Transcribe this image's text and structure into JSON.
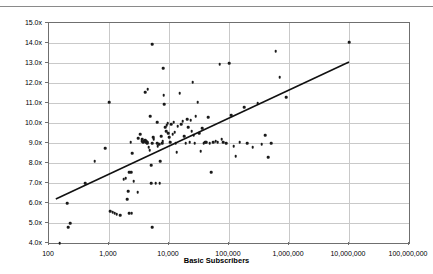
{
  "chart_data": {
    "type": "scatter",
    "title": "",
    "xlabel": "Basic Subscribers",
    "ylabel": "Multiple of Operating Cash Flow",
    "x_scale": "log",
    "y_scale": "linear",
    "xlim": [
      100,
      100000000
    ],
    "ylim": [
      4.0,
      15.0
    ],
    "grid": true,
    "legend": null,
    "x_ticks": [
      100,
      1000,
      10000,
      100000,
      1000000,
      10000000,
      100000000
    ],
    "x_tick_labels": [
      "100",
      "1,000",
      "10,000",
      "100,000",
      "1,000,000",
      "10,000,000",
      "100,000,000"
    ],
    "y_ticks": [
      4.0,
      5.0,
      6.0,
      7.0,
      8.0,
      9.0,
      10.0,
      11.0,
      12.0,
      13.0,
      14.0,
      15.0
    ],
    "y_tick_labels": [
      "4.0x",
      "5.0x",
      "6.0x",
      "7.0x",
      "8.0x",
      "9.0x",
      "10.0x",
      "11.0x",
      "12.0x",
      "13.0x",
      "14.0x",
      "15.0x"
    ],
    "series": [
      {
        "name": "Transactions",
        "marker": "diamond",
        "color": "#1a1a1a",
        "points": [
          [
            150,
            4.0
          ],
          [
            210,
            4.8
          ],
          [
            225,
            5.0
          ],
          [
            200,
            6.0
          ],
          [
            580,
            8.1
          ],
          [
            400,
            7.0
          ],
          [
            860,
            8.75
          ],
          [
            1000,
            11.05
          ],
          [
            1050,
            5.6
          ],
          [
            1150,
            5.55
          ],
          [
            1250,
            5.5
          ],
          [
            1350,
            5.45
          ],
          [
            1550,
            5.4
          ],
          [
            1750,
            7.2
          ],
          [
            1900,
            7.25
          ],
          [
            2000,
            6.2
          ],
          [
            2100,
            6.6
          ],
          [
            2150,
            5.5
          ],
          [
            2400,
            5.5
          ],
          [
            2150,
            7.55
          ],
          [
            2350,
            7.55
          ],
          [
            2300,
            9.05
          ],
          [
            2450,
            8.5
          ],
          [
            2600,
            7.1
          ],
          [
            3000,
            6.55
          ],
          [
            3100,
            9.25
          ],
          [
            3300,
            9.45
          ],
          [
            3500,
            9.1
          ],
          [
            3600,
            9.2
          ],
          [
            3700,
            9.05
          ],
          [
            3900,
            9.1
          ],
          [
            4000,
            9.15
          ],
          [
            4100,
            9.05
          ],
          [
            4200,
            9.1
          ],
          [
            4300,
            9.0
          ],
          [
            4400,
            9.05
          ],
          [
            4000,
            11.55
          ],
          [
            4400,
            11.7
          ],
          [
            4600,
            8.8
          ],
          [
            4800,
            8.65
          ],
          [
            4900,
            10.35
          ],
          [
            5000,
            7.0
          ],
          [
            5100,
            7.9
          ],
          [
            5200,
            4.8
          ],
          [
            5300,
            9.0
          ],
          [
            5400,
            9.3
          ],
          [
            5600,
            9.2
          ],
          [
            5300,
            13.95
          ],
          [
            6000,
            7.0
          ],
          [
            6300,
            9.0
          ],
          [
            6400,
            10.05
          ],
          [
            6500,
            8.85
          ],
          [
            6800,
            8.95
          ],
          [
            7000,
            7.0
          ],
          [
            7100,
            8.1
          ],
          [
            7400,
            9.35
          ],
          [
            7700,
            9.0
          ],
          [
            7900,
            9.1
          ],
          [
            8000,
            12.75
          ],
          [
            8200,
            11.4
          ],
          [
            8400,
            10.95
          ],
          [
            8700,
            9.8
          ],
          [
            9000,
            9.6
          ],
          [
            9200,
            9.9
          ],
          [
            9500,
            10.0
          ],
          [
            9800,
            9.5
          ],
          [
            10000,
            9.3
          ],
          [
            10500,
            9.05
          ],
          [
            11000,
            9.95
          ],
          [
            11500,
            9.45
          ],
          [
            12000,
            10.05
          ],
          [
            12500,
            9.55
          ],
          [
            13000,
            9.0
          ],
          [
            13500,
            8.55
          ],
          [
            14000,
            9.85
          ],
          [
            15000,
            11.5
          ],
          [
            16000,
            9.95
          ],
          [
            17000,
            10.1
          ],
          [
            18000,
            9.35
          ],
          [
            19000,
            9.0
          ],
          [
            20000,
            10.2
          ],
          [
            21000,
            9.8
          ],
          [
            22000,
            9.05
          ],
          [
            23000,
            10.15
          ],
          [
            24000,
            9.6
          ],
          [
            25000,
            12.05
          ],
          [
            26000,
            9.4
          ],
          [
            27000,
            9.0
          ],
          [
            28000,
            10.35
          ],
          [
            30000,
            11.05
          ],
          [
            32000,
            9.5
          ],
          [
            34000,
            8.6
          ],
          [
            36000,
            9.75
          ],
          [
            38000,
            9.0
          ],
          [
            40000,
            9.05
          ],
          [
            42000,
            9.05
          ],
          [
            45000,
            10.3
          ],
          [
            48000,
            9.0
          ],
          [
            50000,
            7.55
          ],
          [
            55000,
            9.05
          ],
          [
            60000,
            9.1
          ],
          [
            65000,
            9.05
          ],
          [
            70000,
            12.95
          ],
          [
            75000,
            9.2
          ],
          [
            80000,
            9.05
          ],
          [
            90000,
            9.0
          ],
          [
            100000,
            13.0
          ],
          [
            110000,
            10.4
          ],
          [
            120000,
            8.85
          ],
          [
            130000,
            8.35
          ],
          [
            150000,
            9.05
          ],
          [
            180000,
            10.8
          ],
          [
            200000,
            9.0
          ],
          [
            250000,
            8.8
          ],
          [
            300000,
            11.0
          ],
          [
            350000,
            8.95
          ],
          [
            400000,
            9.4
          ],
          [
            450000,
            8.3
          ],
          [
            500000,
            9.0
          ],
          [
            600000,
            13.6
          ],
          [
            700000,
            12.3
          ],
          [
            900000,
            11.3
          ],
          [
            10000000,
            14.05
          ]
        ]
      }
    ],
    "trendline": {
      "name": "linear-fit-on-log-x",
      "visible": true,
      "color": "#111111",
      "x_start": 130,
      "y_start": 6.2,
      "x_end": 10000000,
      "y_end": 13.05
    }
  }
}
